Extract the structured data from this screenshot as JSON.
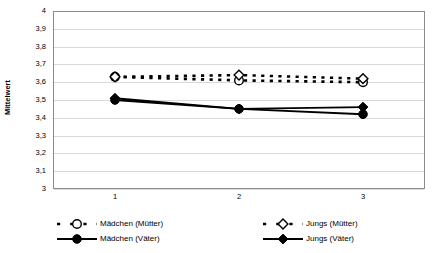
{
  "chart_data": {
    "type": "line",
    "title": "",
    "xlabel": "",
    "ylabel": "Mittelwert",
    "categories": [
      "1",
      "2",
      "3"
    ],
    "ylim": [
      3,
      4
    ],
    "ytick_labels": [
      "4",
      "3,9",
      "3,8",
      "3,7",
      "3,6",
      "3,5",
      "3,4",
      "3,3",
      "3,2",
      "3,1",
      "3"
    ],
    "ytick_values": [
      4,
      3.9,
      3.8,
      3.7,
      3.6,
      3.5,
      3.4,
      3.3,
      3.2,
      3.1,
      3
    ],
    "grid": true,
    "legend_position": "bottom",
    "series": [
      {
        "name": "Mädchen (Mütter)",
        "values": [
          3.63,
          3.61,
          3.6
        ],
        "line_style": "dashed",
        "marker": "open-circle",
        "color": "#000000"
      },
      {
        "name": "Jungs (Mütter)",
        "values": [
          3.63,
          3.64,
          3.62
        ],
        "line_style": "dashed",
        "marker": "open-diamond",
        "color": "#000000"
      },
      {
        "name": "Mädchen (Väter)",
        "values": [
          3.5,
          3.45,
          3.42
        ],
        "line_style": "solid",
        "marker": "filled-circle",
        "color": "#000000"
      },
      {
        "name": "Jungs (Väter)",
        "values": [
          3.51,
          3.45,
          3.46
        ],
        "line_style": "solid",
        "marker": "filled-diamond",
        "color": "#000000"
      }
    ]
  },
  "title_strip": {
    "text": ""
  }
}
